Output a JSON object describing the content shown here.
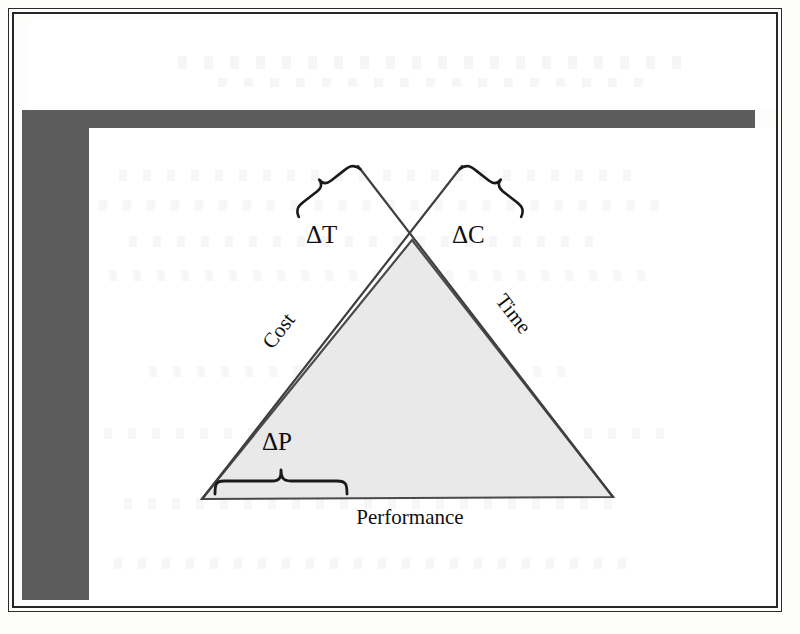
{
  "document": {
    "kind": "scanned-book-figure",
    "page_background": "#fdfdfc",
    "band_color": "#5c5c5c",
    "rule_color": "#262626"
  },
  "figure": {
    "name": "project-management-triangle",
    "triangle": {
      "fill": "#e9e9e9",
      "stroke": "#4a4a4a",
      "apex": {
        "x": 412,
        "y": 240
      },
      "base_left": {
        "x": 202,
        "y": 499
      },
      "base_right": {
        "x": 613,
        "y": 497
      }
    },
    "edge_labels": {
      "left": "Cost",
      "right": "Time",
      "base": "Performance"
    },
    "delta_labels": {
      "left": "ΔT",
      "right": "ΔC",
      "bottom": "ΔP"
    },
    "braces": {
      "left": {
        "label": "ΔT",
        "orientation": "diagonal-up-right"
      },
      "right": {
        "label": "ΔC",
        "orientation": "diagonal-up-left"
      },
      "bottom": {
        "label": "ΔP",
        "orientation": "horizontal-down"
      }
    },
    "crossing_lines": {
      "description": "triangle legs extended beyond apex forming an X",
      "stroke": "#3f3f3f"
    }
  }
}
